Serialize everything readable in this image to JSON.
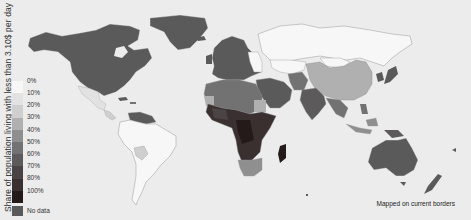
{
  "map": {
    "background": "#ececec",
    "ocean_color": "#ececec",
    "y_axis_label": "Share of population living with less than 3.10$ per day",
    "note": "Mapped on current borders"
  },
  "legend": {
    "items": [
      {
        "label": "0%",
        "color": "#f7f7f7"
      },
      {
        "label": "10%",
        "color": "#e2e2e2"
      },
      {
        "label": "20%",
        "color": "#cfcfcf"
      },
      {
        "label": "30%",
        "color": "#b0b0b0"
      },
      {
        "label": "40%",
        "color": "#8f8f8f"
      },
      {
        "label": "50%",
        "color": "#727272"
      },
      {
        "label": "60%",
        "color": "#5c5a5a"
      },
      {
        "label": "70%",
        "color": "#4a4444"
      },
      {
        "label": "80%",
        "color": "#3a3030"
      },
      {
        "label": "100%",
        "color": "#241a1a"
      }
    ],
    "no_data": {
      "label": "No data",
      "color": "#5a5a5a"
    }
  },
  "regions": {
    "north_america": {
      "name": "North America",
      "value": "No data"
    },
    "greenland": {
      "name": "Greenland",
      "value": "No data"
    },
    "mexico": {
      "name": "Mexico",
      "value": "10%"
    },
    "central_america": {
      "name": "Central America",
      "value": "20%"
    },
    "venezuela": {
      "name": "Venezuela",
      "value": "No data"
    },
    "south_america": {
      "name": "South America",
      "value": "0%-10%"
    },
    "bolivia": {
      "name": "Bolivia",
      "value": "20%"
    },
    "europe": {
      "name": "Western Europe",
      "value": "No data"
    },
    "russia": {
      "name": "Russia",
      "value": "0%"
    },
    "china": {
      "name": "China",
      "value": "20%-30%"
    },
    "north_africa": {
      "name": "North Africa",
      "value": "50%"
    },
    "sub_saharan_africa": {
      "name": "Sub-Saharan Africa",
      "value": "70%-100%"
    },
    "southern_africa": {
      "name": "Southern Africa",
      "value": "40%"
    },
    "madagascar": {
      "name": "Madagascar",
      "value": "100%"
    },
    "middle_east": {
      "name": "Middle East",
      "value": "No data"
    },
    "india": {
      "name": "India",
      "value": "60%"
    },
    "southeast_asia": {
      "name": "Southeast Asia",
      "value": "40%-60%"
    },
    "japan_korea": {
      "name": "Japan / Korea",
      "value": "No data"
    },
    "australia": {
      "name": "Australia",
      "value": "No data"
    },
    "new_zealand": {
      "name": "New Zealand",
      "value": "No data"
    }
  }
}
